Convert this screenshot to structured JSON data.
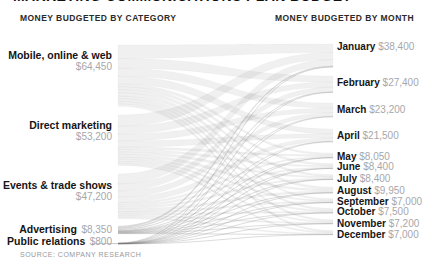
{
  "page": {
    "clipped_title": "MARKETING COMMUNICATIONS PLAN BUDGET"
  },
  "headers": {
    "left": "MONEY BUDGETED BY CATEGORY",
    "right": "MONEY BUDGETED BY MONTH"
  },
  "source_note": "SOURCE: COMPANY RESEARCH",
  "colors": {
    "flow": "#8c8c8c",
    "flow_edge": "#6f6f6f",
    "label": "#151515",
    "value": "#a7a7ab",
    "header": "#2a2a2a",
    "source": "#98989c"
  },
  "chart_data": {
    "type": "sankey",
    "orientation": "left-to-right",
    "left_axis_title": "MONEY BUDGETED BY CATEGORY",
    "right_axis_title": "MONEY BUDGETED BY MONTH",
    "total": 174000,
    "flow_allocation": "proportional (individual flow values not labeled in chart)",
    "categories": [
      {
        "label": "Mobile, online & web",
        "value": 64450,
        "value_label": "$64,450"
      },
      {
        "label": "Direct marketing",
        "value": 53200,
        "value_label": "$53,200"
      },
      {
        "label": "Events & trade shows",
        "value": 47200,
        "value_label": "$47,200"
      },
      {
        "label": "Advertising",
        "value": 8350,
        "value_label": "$8,350"
      },
      {
        "label": "Public relations",
        "value": 800,
        "value_label": "$800"
      }
    ],
    "months": [
      {
        "label": "January",
        "value": 38400,
        "value_label": "$38,400"
      },
      {
        "label": "February",
        "value": 27400,
        "value_label": "$27,400"
      },
      {
        "label": "March",
        "value": 23200,
        "value_label": "$23,200"
      },
      {
        "label": "April",
        "value": 21500,
        "value_label": "$21,500"
      },
      {
        "label": "May",
        "value": 8050,
        "value_label": "$8,050"
      },
      {
        "label": "June",
        "value": 8400,
        "value_label": "$8,400"
      },
      {
        "label": "July",
        "value": 8400,
        "value_label": "$8,400"
      },
      {
        "label": "August",
        "value": 9950,
        "value_label": "$9,950"
      },
      {
        "label": "September",
        "value": 7000,
        "value_label": "$7,000"
      },
      {
        "label": "October",
        "value": 7500,
        "value_label": "$7,500"
      },
      {
        "label": "November",
        "value": 7200,
        "value_label": "$7,200"
      },
      {
        "label": "December",
        "value": 7000,
        "value_label": "$7,000"
      }
    ]
  }
}
